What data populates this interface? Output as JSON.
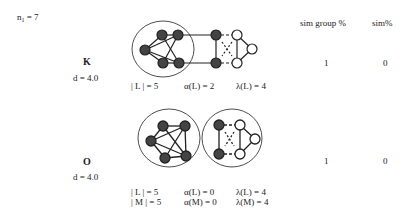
{
  "header": {
    "n_label": "n",
    "n_sub": "1",
    "n_value": " = 7",
    "col_sim_group": "sim group %",
    "col_sim": "sim%"
  },
  "rows": [
    {
      "name": "K",
      "distance": "d = 4.0",
      "stats": [
        "| L | = 5",
        "α(L) = 2",
        "λ(L) = 4"
      ],
      "sim_group": "1",
      "sim": "0"
    },
    {
      "name": "O",
      "distance": "d = 4.0",
      "stats_line1": [
        "| L | = 5",
        "α(L) = 0",
        "λ(L) = 4"
      ],
      "stats_line2": [
        "| M | = 5",
        "α(M) = 0",
        "λ(M) = 4"
      ],
      "sim_group": "1",
      "sim": "0"
    }
  ],
  "colors": {
    "filled_node": "#444444",
    "open_node": "#ffffff",
    "stroke": "#222222"
  }
}
